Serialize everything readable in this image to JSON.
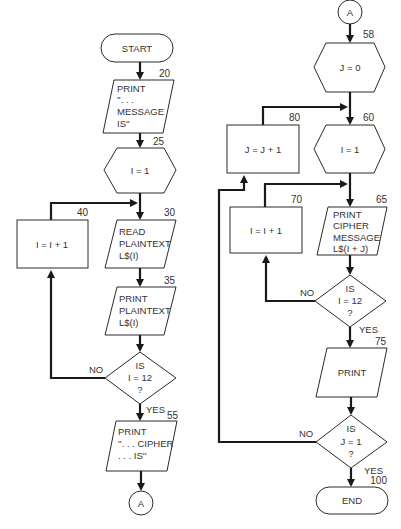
{
  "diagram": {
    "type": "flowchart",
    "left_column": {
      "start": {
        "label": "START"
      },
      "step_20": {
        "number": "20",
        "lines": [
          "PRINT",
          "''. . .",
          "MESSAGE",
          "IS''"
        ]
      },
      "step_25": {
        "number": "25",
        "label": "I = 1"
      },
      "step_30": {
        "number": "30",
        "lines": [
          "READ",
          "PLAINTEXT",
          "L$(I)"
        ]
      },
      "step_35": {
        "number": "35",
        "lines": [
          "PRINT",
          "PLAINTEXT",
          "L$(I)"
        ]
      },
      "step_40": {
        "number": "40",
        "label": "I = I + 1"
      },
      "decision_i12": {
        "lines": [
          "IS",
          "I  =  12",
          "?"
        ],
        "no_label": "NO",
        "yes_label": "YES"
      },
      "step_55": {
        "number": "55",
        "lines": [
          "PRINT",
          "''. . . CIPHER",
          ". . . IS''"
        ]
      },
      "connector_out": {
        "label": "A"
      }
    },
    "right_column": {
      "connector_in": {
        "label": "A"
      },
      "step_58": {
        "number": "58",
        "label": "J = 0"
      },
      "step_60": {
        "number": "60",
        "label": "I = 1"
      },
      "step_65": {
        "number": "65",
        "lines": [
          "PRINT",
          "CIPHER",
          "MESSAGE",
          "L$(I + J)"
        ]
      },
      "step_70": {
        "number": "70",
        "label": "I = I + 1"
      },
      "step_75": {
        "number": "75",
        "label": "PRINT"
      },
      "step_80": {
        "number": "80",
        "label": "J = J + 1"
      },
      "decision_i12": {
        "lines": [
          "IS",
          "I  =  12",
          "?"
        ],
        "no_label": "NO",
        "yes_label": "YES"
      },
      "decision_j1": {
        "lines": [
          "IS",
          "J  =  1",
          "?"
        ],
        "no_label": "NO",
        "yes_label": "YES"
      },
      "end": {
        "number": "100",
        "label": "END"
      }
    }
  }
}
